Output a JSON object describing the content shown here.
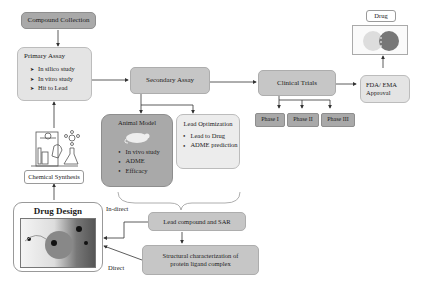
{
  "nodes": {
    "compound_collection": "Compound Collection",
    "primary_assay": {
      "title": "Primary Assay",
      "items": [
        "In silico study",
        "In vitro study",
        "Hit to Lead"
      ]
    },
    "chemical_synthesis": "Chemical Synthesis",
    "drug_design": "Drug Design",
    "secondary_assay": "Secondary Assay",
    "animal_model": {
      "title": "Animal Model",
      "items": [
        "In vivo study",
        "ADME",
        "Efficacy"
      ]
    },
    "lead_optimization": {
      "title": "Lead Optimization",
      "items": [
        "Lead to Drug",
        "ADME prediction"
      ]
    },
    "clinical_trials": "Clinical Trials",
    "phases": [
      "Phase I",
      "Phase II",
      "Phase III"
    ],
    "fda_ema": "FDA/ EMA Approval",
    "drug": "Drug",
    "lead_compound_sar": "Lead compound and SAR",
    "structural_characterization": "Structural characterization of protein ligand complex"
  },
  "edge_labels": {
    "indirect": "In-direct",
    "direct": "Direct"
  },
  "colors": {
    "dark_box": "#a9a9a9",
    "mid_box": "#c6c6c6",
    "light_box": "#e4e4e4",
    "line": "#333333"
  }
}
